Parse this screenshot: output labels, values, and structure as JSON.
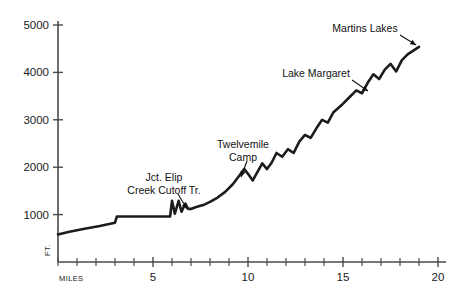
{
  "chart_data": {
    "type": "line",
    "title": "",
    "xlabel": "MILES",
    "ylabel": "FT.",
    "xlim": [
      0,
      20
    ],
    "ylim": [
      0,
      5000
    ],
    "grid": false,
    "legend": null,
    "x_tick_labels": [
      "5",
      "10",
      "15",
      "20"
    ],
    "x_tick_values": [
      5,
      10,
      15,
      20
    ],
    "x_minor_ticks": [
      0,
      1,
      2,
      3,
      4,
      5,
      6,
      7,
      8,
      9,
      10,
      11,
      12,
      13,
      14,
      15,
      16,
      17,
      18,
      19,
      20
    ],
    "y_tick_labels": [
      "1000",
      "2000",
      "3000",
      "4000",
      "5000"
    ],
    "y_tick_values": [
      1000,
      2000,
      3000,
      4000,
      5000
    ],
    "series": [
      {
        "name": "Trail elevation profile",
        "x": [
          0.0,
          0.6,
          1.4,
          2.2,
          3.0,
          3.1,
          3.15,
          4.0,
          4.8,
          5.5,
          5.9,
          6.0,
          6.15,
          6.35,
          6.5,
          6.7,
          6.85,
          7.0,
          7.2,
          7.45,
          7.7,
          8.0,
          8.4,
          8.8,
          9.2,
          9.5,
          9.8,
          10.0,
          10.25,
          10.5,
          10.75,
          11.0,
          11.25,
          11.5,
          11.8,
          12.1,
          12.4,
          12.7,
          13.0,
          13.3,
          13.6,
          13.9,
          14.2,
          14.5,
          14.9,
          15.3,
          15.7,
          16.0,
          16.3,
          16.6,
          16.9,
          17.2,
          17.5,
          17.8,
          18.1,
          18.4,
          18.7,
          19.0
        ],
        "y": [
          580,
          640,
          700,
          760,
          830,
          960,
          960,
          960,
          960,
          960,
          960,
          1290,
          1020,
          1290,
          1060,
          1230,
          1120,
          1120,
          1150,
          1180,
          1210,
          1270,
          1360,
          1480,
          1640,
          1800,
          1960,
          1860,
          1720,
          1900,
          2080,
          1960,
          2100,
          2300,
          2220,
          2380,
          2300,
          2540,
          2680,
          2620,
          2820,
          3000,
          2940,
          3160,
          3300,
          3460,
          3620,
          3560,
          3780,
          3960,
          3860,
          4060,
          4180,
          4020,
          4260,
          4380,
          4460,
          4540
        ]
      }
    ],
    "annotations": [
      {
        "name": "jct-elip-creek-cutoff",
        "lines": [
          "Jct. Elip",
          "Creek Cutoff Tr."
        ],
        "text_x": 164,
        "text_y": 181,
        "leader": {
          "x1": 178,
          "y1": 194,
          "x2": 187,
          "y2": 209
        }
      },
      {
        "name": "twelvemile-camp",
        "lines": [
          "Twelvemile",
          "Camp"
        ],
        "text_x": 243,
        "text_y": 148,
        "leader": {
          "x1": 247,
          "y1": 161,
          "x2": 241,
          "y2": 177
        }
      },
      {
        "name": "lake-margaret",
        "lines": [
          "Lake Margaret"
        ],
        "text_x": 316,
        "text_y": 77,
        "leader": {
          "x1": 352,
          "y1": 80,
          "x2": 368,
          "y2": 91
        }
      },
      {
        "name": "martins-lakes",
        "lines": [
          "Martins Lakes"
        ],
        "text_x": 365,
        "text_y": 32,
        "leader": {
          "x1": 400,
          "y1": 35,
          "x2": 416,
          "y2": 45
        }
      }
    ],
    "colors": {
      "line": "#1c1c1c",
      "axis": "#4a4a4a",
      "text": "#111111",
      "background": "#ffffff"
    }
  }
}
